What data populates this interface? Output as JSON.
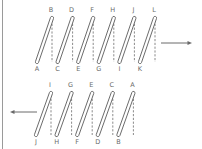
{
  "diagram": {
    "title": "",
    "colors": {
      "coil_stroke": "#5a5a5a",
      "dash": "#6d6d6d",
      "label": "#6b6b6b",
      "arrow": "#6a6a6a",
      "frame_line": "#9a9a9a"
    },
    "top_coil": {
      "direction": "right",
      "top_labels": [
        "B",
        "D",
        "F",
        "H",
        "J",
        "L"
      ],
      "bottom_labels": [
        "A",
        "C",
        "E",
        "G",
        "I",
        "K"
      ],
      "turns": 6
    },
    "bottom_coil": {
      "direction": "left",
      "top_labels": [
        "I",
        "G",
        "E",
        "C",
        "A"
      ],
      "bottom_labels": [
        "J",
        "H",
        "F",
        "D",
        "B"
      ],
      "turns": 5
    }
  }
}
